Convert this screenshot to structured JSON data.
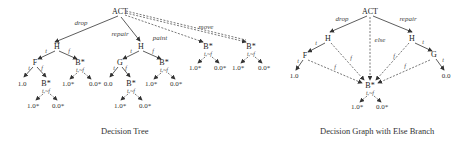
{
  "captions": {
    "left": "Decision Tree",
    "right": "Decision Graph with Else Branch"
  },
  "decision_tree": {
    "root": "ACT",
    "edge_labels": {
      "drop": "drop",
      "repair": "repair",
      "paint": "paint",
      "move": "move",
      "t": "t",
      "f": "f",
      "tnf": "t,~f",
      "else": "else"
    },
    "nodes": {
      "H": "H",
      "F": "F",
      "G": "G",
      "B": "B*"
    },
    "leaves": {
      "one": "1.0",
      "zero": "0.0",
      "one_star": "1.0*",
      "zero_star": "0.0*"
    }
  },
  "decision_graph": {
    "root": "ACT",
    "edge_labels": {
      "drop": "drop",
      "repair": "repair",
      "else": "else",
      "t": "t",
      "f": "f",
      "tnf": "t,~f"
    },
    "nodes": {
      "H": "H",
      "F": "F",
      "G": "G",
      "B": "B*"
    },
    "leaves": {
      "one": "1.0",
      "zero": "0.0",
      "one_star": "1.0*",
      "zero_star": "0.0*"
    }
  }
}
